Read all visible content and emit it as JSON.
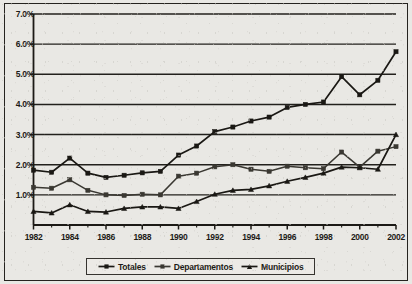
{
  "chart_data": {
    "type": "line",
    "title": "",
    "xlabel": "",
    "ylabel": "",
    "ylim": [
      0,
      7
    ],
    "xlim": [
      1982,
      2002
    ],
    "grid": true,
    "grid_axis": "y",
    "legend_position": "bottom",
    "ytick_labels": [
      "7.0%",
      "6.0%",
      "5.0%",
      "4.0%",
      "3.0%",
      "2.0%",
      "1.0%"
    ],
    "ytick_values": [
      7,
      6,
      5,
      4,
      3,
      2,
      1
    ],
    "xtick_labels": [
      "1982",
      "1984",
      "1986",
      "1988",
      "1990",
      "1992",
      "1994",
      "1996",
      "1998",
      "2000",
      "2002"
    ],
    "xtick_values": [
      1982,
      1984,
      1986,
      1988,
      1990,
      1992,
      1994,
      1996,
      1998,
      2000,
      2002
    ],
    "x": [
      1982,
      1983,
      1984,
      1985,
      1986,
      1987,
      1988,
      1989,
      1990,
      1991,
      1992,
      1993,
      1994,
      1995,
      1996,
      1997,
      1998,
      1999,
      2000,
      2001,
      2002
    ],
    "series": [
      {
        "name": "Totales",
        "marker": "square",
        "color": "#1a1814",
        "values": [
          1.82,
          1.75,
          2.22,
          1.72,
          1.58,
          1.65,
          1.73,
          1.78,
          2.32,
          2.62,
          3.1,
          3.25,
          3.45,
          3.58,
          3.9,
          4.0,
          4.08,
          4.92,
          4.32,
          4.8,
          5.75
        ]
      },
      {
        "name": "Departamentos",
        "marker": "square",
        "color": "#3a3832",
        "values": [
          1.25,
          1.22,
          1.5,
          1.15,
          1.0,
          0.98,
          1.02,
          1.0,
          1.62,
          1.72,
          1.93,
          2.0,
          1.85,
          1.78,
          1.95,
          1.9,
          1.87,
          2.42,
          1.92,
          2.45,
          2.6
        ]
      },
      {
        "name": "Municipios",
        "marker": "triangle",
        "color": "#1a1814",
        "values": [
          0.45,
          0.4,
          0.67,
          0.45,
          0.43,
          0.55,
          0.6,
          0.6,
          0.55,
          0.78,
          1.02,
          1.15,
          1.18,
          1.3,
          1.45,
          1.58,
          1.72,
          1.92,
          1.9,
          1.85,
          3.0
        ]
      }
    ]
  },
  "legend": {
    "entries": [
      {
        "label": "Totales"
      },
      {
        "label": "Departamentos"
      },
      {
        "label": "Municipios"
      }
    ]
  }
}
